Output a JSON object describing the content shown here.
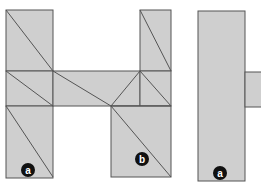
{
  "figure": {
    "colors": {
      "fill": "#cfcfcf",
      "stroke": "#555555",
      "badge": "#111111",
      "badge_text": "#ffffff"
    },
    "labels": {
      "left_a": "a",
      "middle_b": "b",
      "right_a": "a"
    }
  }
}
